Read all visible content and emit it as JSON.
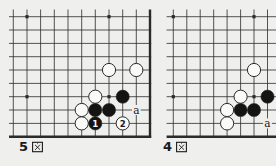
{
  "page": {
    "background": "#efefed",
    "line_color": "#2b2b28",
    "text_color": "#1b1b1b",
    "stone_black_fill": "#141412",
    "stone_white_fill": "#fafaf8",
    "stone_stroke": "#2a2a28"
  },
  "diagrams": [
    {
      "id": "fig5",
      "label": "5図",
      "digit": "5",
      "board": {
        "x_lines": [
          13.3,
          27,
          40.6,
          54.3,
          68,
          81.7,
          95.3,
          109,
          122.7,
          136.3,
          150
        ],
        "y_lines": [
          16.7,
          30,
          43.4,
          56.7,
          70,
          83.4,
          96.7,
          110,
          123.4,
          136.7
        ],
        "h_extent": [
          9,
          151.2
        ],
        "v_extent": [
          9.5,
          137.9
        ],
        "thick_right_edge": true,
        "thick_bottom_edge": true,
        "stars": [
          [
            1,
            0
          ],
          [
            7,
            0
          ],
          [
            1,
            6
          ],
          [
            7,
            6
          ]
        ],
        "stones": [
          {
            "color": "white",
            "col": 7,
            "row": 4
          },
          {
            "color": "white",
            "col": 9,
            "row": 4
          },
          {
            "color": "white",
            "col": 6,
            "row": 6
          },
          {
            "color": "black",
            "col": 8,
            "row": 6
          },
          {
            "color": "white",
            "col": 5,
            "row": 7
          },
          {
            "color": "black",
            "col": 6,
            "row": 7
          },
          {
            "color": "black",
            "col": 7,
            "row": 7
          },
          {
            "color": "white",
            "col": 5,
            "row": 8
          },
          {
            "color": "black",
            "col": 6,
            "row": 8,
            "number": "1"
          },
          {
            "color": "white",
            "col": 8,
            "row": 8,
            "number": "2"
          }
        ],
        "letters": [
          {
            "text": "a",
            "col": 9,
            "row": 7
          }
        ]
      }
    },
    {
      "id": "fig4",
      "label": "4図",
      "digit": "4",
      "board": {
        "x_lines": [
          173.3,
          186.8,
          200.2,
          213.7,
          227.1,
          240.6,
          254,
          267.5,
          281
        ],
        "y_lines": [
          16.7,
          30,
          43.4,
          56.7,
          70,
          83.4,
          96.7,
          110,
          123.4,
          136.7
        ],
        "h_extent": [
          166.6,
          276
        ],
        "v_extent": [
          9.5,
          137.9
        ],
        "thick_right_edge": false,
        "thick_bottom_edge": true,
        "stars": [
          [
            0,
            0
          ],
          [
            6,
            0
          ],
          [
            0,
            6
          ],
          [
            6,
            6
          ]
        ],
        "stones": [
          {
            "color": "white",
            "col": 6,
            "row": 4
          },
          {
            "color": "white",
            "col": 5,
            "row": 6
          },
          {
            "color": "black",
            "col": 7,
            "row": 6
          },
          {
            "color": "white",
            "col": 4,
            "row": 7
          },
          {
            "color": "black",
            "col": 5,
            "row": 7
          },
          {
            "color": "black",
            "col": 6,
            "row": 7
          },
          {
            "color": "white",
            "col": 4,
            "row": 8
          }
        ],
        "letters": [
          {
            "text": "a",
            "col": 7,
            "row": 8
          }
        ]
      }
    }
  ]
}
